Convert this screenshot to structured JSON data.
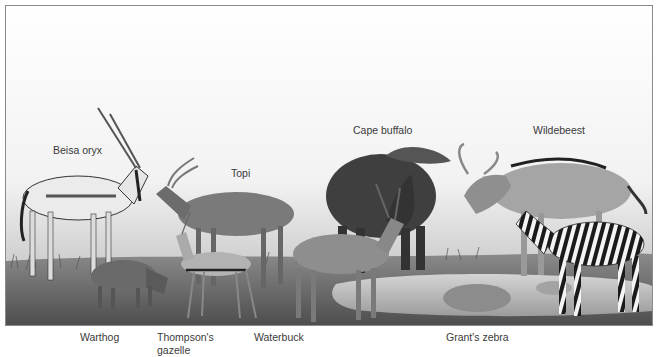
{
  "figure": {
    "style": "grayscale illustration of African savanna grazers at a watering hole",
    "colors": {
      "sky_top": "#ffffff",
      "sky_horizon": "#d9d9d9",
      "grass": "#6f6f6f",
      "water": "#b9b9b9",
      "frame_border": "#8a8a8a",
      "label_text": "#3a3a3a"
    },
    "labels_top": [
      {
        "text": "Beisa oryx"
      },
      {
        "text": "Topi"
      },
      {
        "text": "Cape buffalo"
      },
      {
        "text": "Wildebeest"
      }
    ],
    "labels_bottom": [
      {
        "text": "Warthog"
      },
      {
        "text": "Thompson's gazelle"
      },
      {
        "text": "Waterbuck"
      },
      {
        "text": "Grant's zebra"
      }
    ]
  }
}
